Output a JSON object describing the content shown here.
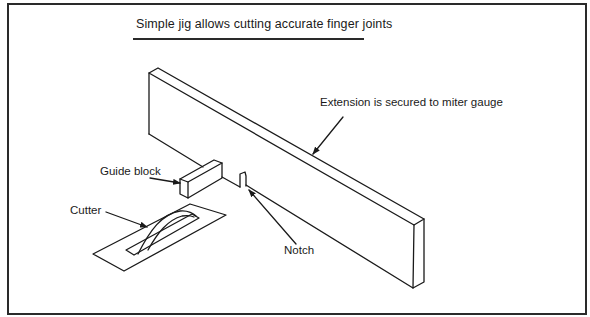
{
  "figure": {
    "title": "Simple jig allows cutting accurate finger joints",
    "callouts": {
      "extension": "Extension is secured to miter gauge",
      "guide_block": "Guide block",
      "cutter": "Cutter",
      "notch": "Notch"
    },
    "colors": {
      "line": "#1a1a1a",
      "background": "#ffffff",
      "frame": "#2a2a2a"
    }
  }
}
